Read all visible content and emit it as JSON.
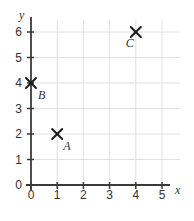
{
  "chart_data": {
    "type": "scatter",
    "title": "",
    "xlabel": "x",
    "ylabel": "y",
    "xlim": [
      0,
      5.6
    ],
    "ylim": [
      0,
      6.5
    ],
    "x_ticks": [
      0,
      1,
      2,
      3,
      4,
      5
    ],
    "y_ticks": [
      0,
      1,
      2,
      3,
      4,
      5,
      6
    ],
    "grid": true,
    "legend": false,
    "marker": "x",
    "points": [
      {
        "label": "A",
        "x": 1,
        "y": 2,
        "label_dx": 6,
        "label_dy": 16
      },
      {
        "label": "B",
        "x": 0,
        "y": 4,
        "label_dx": 7,
        "label_dy": 16
      },
      {
        "label": "C",
        "x": 4,
        "y": 6,
        "label_dx": -10,
        "label_dy": 15
      }
    ],
    "colors": {
      "axis": "#3a3a3a",
      "grid": "#e0e0e0",
      "marker": "#1c1c1c",
      "text": "#333333"
    }
  }
}
